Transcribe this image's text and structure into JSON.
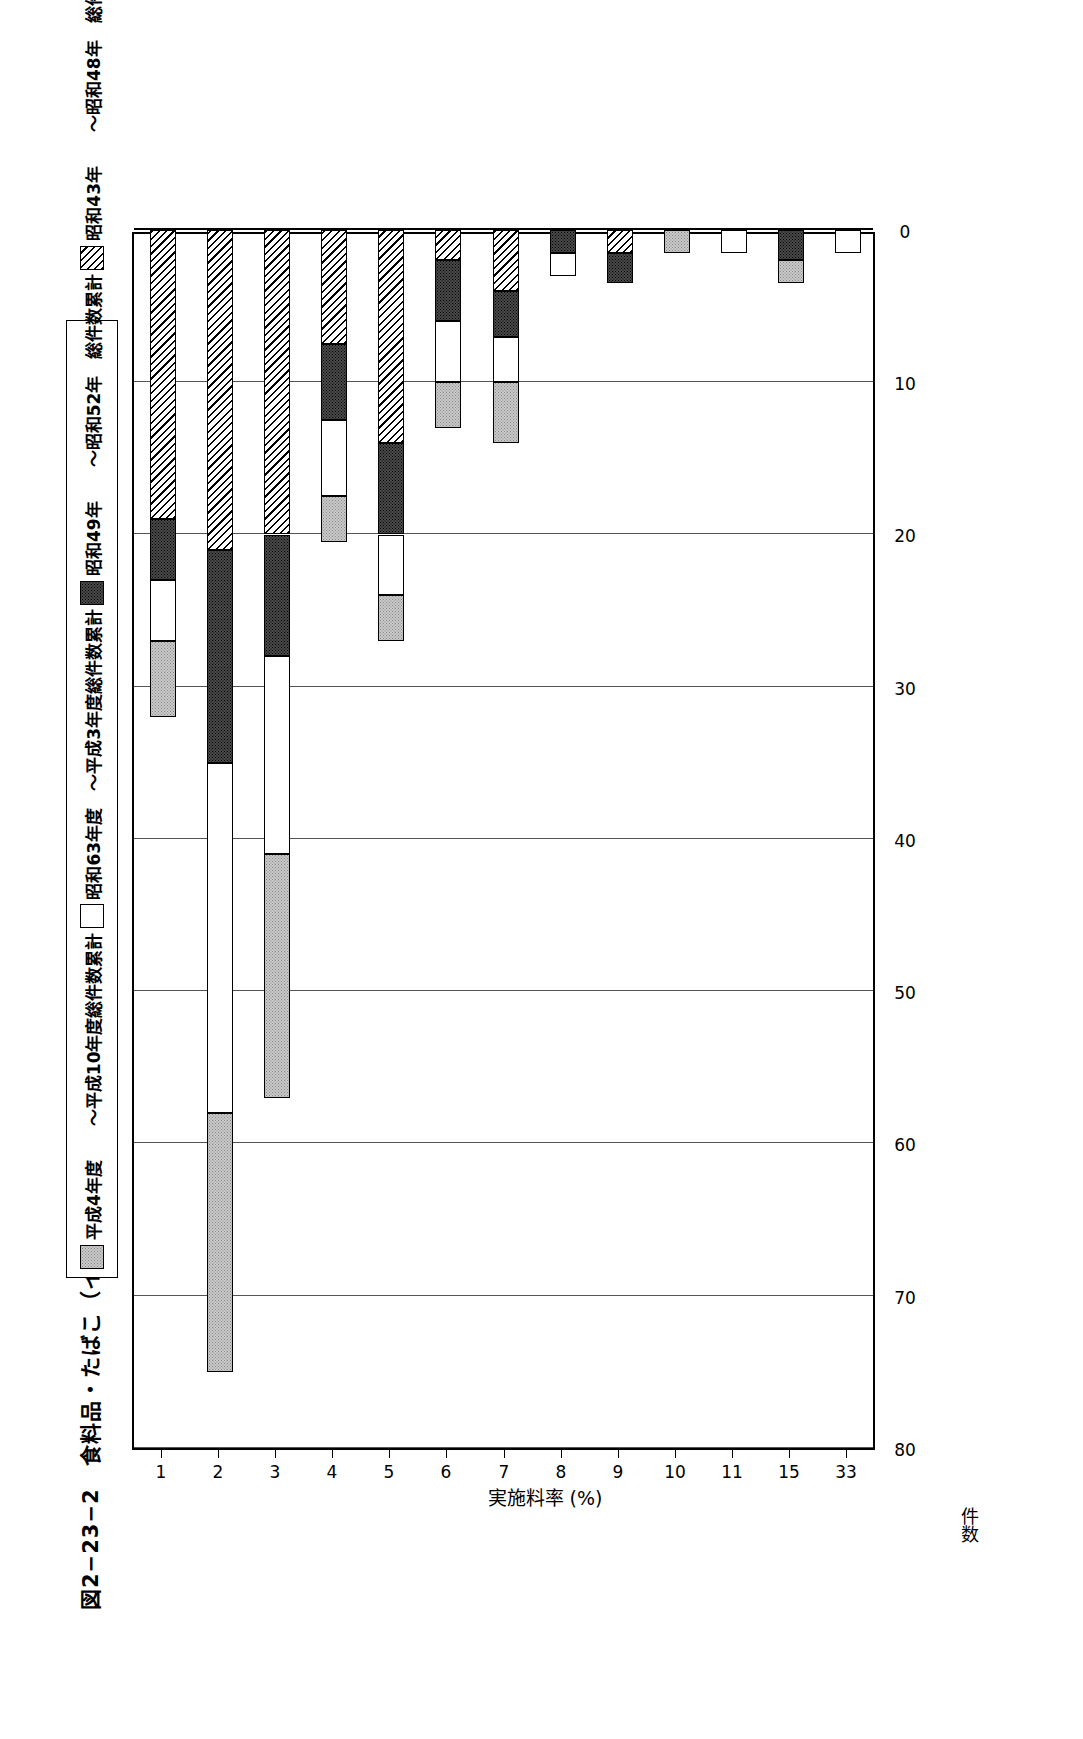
{
  "figure": {
    "title": "図2−23−2　食料品・たばこ（イニシャル　無）の実施料率別契約件数"
  },
  "legend": {
    "items": [
      {
        "label": "平成4年度　　～平成10年度総件数累計",
        "fill": "lightgray",
        "color": "#c9c9c9"
      },
      {
        "label": "昭和63年度　～平成3年度総件数累計",
        "fill": "white",
        "color": "#ffffff"
      },
      {
        "label": "昭和49年　　～昭和52年　総件数累計",
        "fill": "darkgray",
        "color": "#4a4a4a"
      },
      {
        "label": "昭和43年　　～昭和48年　総件数累計",
        "fill": "hatch",
        "color": "#ffffff"
      }
    ]
  },
  "axes": {
    "category_axis_title": "実施料率 (%)",
    "value_axis_title": "件数",
    "value_ticks": [
      "80",
      "70",
      "60",
      "50",
      "40",
      "30",
      "20",
      "10",
      "0"
    ]
  },
  "chart_data": {
    "type": "bar",
    "orientation": "horizontal",
    "stacked": true,
    "title": "図2−23−2　食料品・たばこ（イニシャル　無）の実施料率別契約件数",
    "xlabel": "実施料率 (%)",
    "ylabel": "件数",
    "ylim": [
      0,
      80
    ],
    "grid": true,
    "legend_position": "top",
    "categories": [
      "1",
      "2",
      "3",
      "4",
      "5",
      "6",
      "7",
      "8",
      "9",
      "10",
      "11",
      "15",
      "33"
    ],
    "series": [
      {
        "name": "昭和43年　　～昭和48年　総件数累計",
        "fill": "hatch",
        "values": [
          19,
          21,
          20,
          7.5,
          14,
          2,
          4,
          0,
          1.5,
          0,
          0,
          0,
          0
        ]
      },
      {
        "name": "昭和49年　　～昭和52年　総件数累計",
        "fill": "darkgray",
        "values": [
          4,
          14,
          8,
          5,
          6,
          4,
          3,
          1.5,
          2,
          0,
          0,
          2,
          0
        ]
      },
      {
        "name": "昭和63年度　～平成3年度総件数累計",
        "fill": "white",
        "values": [
          4,
          23,
          13,
          5,
          4,
          4,
          3,
          1.5,
          0,
          0,
          1.5,
          0,
          1.5
        ]
      },
      {
        "name": "平成4年度　　～平成10年度総件数累計",
        "fill": "lightgray",
        "values": [
          5,
          17,
          16,
          3,
          3,
          3,
          4,
          0,
          0,
          1.5,
          0,
          1.5,
          0
        ]
      }
    ],
    "totals": [
      32,
      75,
      57,
      20.5,
      27,
      13,
      14,
      3,
      3.5,
      1.5,
      1.5,
      3.5,
      1.5
    ]
  }
}
